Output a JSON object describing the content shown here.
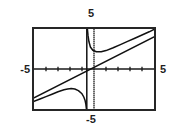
{
  "figure": {
    "type": "graphing-calculator-plot",
    "frame": {
      "x": 32,
      "y": 27,
      "width": 124,
      "height": 84
    }
  },
  "labels": {
    "top": "5",
    "bottom": "-5",
    "left": "-5",
    "right": "5"
  },
  "colors": {
    "frame": "#262626",
    "axis": "#1a1a1a",
    "curve": "#111111",
    "background": "#ffffff"
  },
  "chart_data": {
    "type": "line",
    "title": "",
    "xlabel": "",
    "ylabel": "",
    "xlim": [
      -5,
      5
    ],
    "ylim": [
      -5,
      5
    ],
    "xticks": [
      -4,
      -3,
      -2,
      -1,
      1,
      2,
      3,
      4
    ],
    "yticks": [
      -4,
      -3,
      -2,
      -1,
      1,
      2,
      3,
      4
    ],
    "grid": false,
    "legend": false,
    "axis_tick_labels": {
      "x_min": "-5",
      "x_max": "5",
      "y_min": "-5",
      "y_max": "5"
    },
    "vertical_asymptote": -0.6,
    "series": [
      {
        "name": "slant-asymptote",
        "style": "solid-line",
        "x": [
          -5,
          5
        ],
        "values": [
          -3.6,
          4.0
        ]
      },
      {
        "name": "rational-curve-left-branch",
        "style": "solid-curve",
        "x": [
          -5.0,
          -4.5,
          -4.0,
          -3.5,
          -3.0,
          -2.5,
          -2.2,
          -1.9,
          -1.6,
          -1.3,
          -1.0,
          -0.85,
          -0.75,
          -0.68,
          -0.63
        ],
        "values": [
          -4.05,
          -3.75,
          -3.45,
          -3.15,
          -2.85,
          -2.6,
          -2.5,
          -2.45,
          -2.5,
          -2.7,
          -3.1,
          -3.5,
          -3.9,
          -4.4,
          -5.0
        ]
      },
      {
        "name": "rational-curve-right-branch",
        "style": "solid-curve",
        "x": [
          -0.55,
          -0.5,
          -0.42,
          -0.3,
          -0.1,
          0.2,
          0.6,
          1.0,
          1.6,
          2.2,
          2.8,
          3.4,
          4.0,
          4.6,
          5.0
        ],
        "values": [
          5.0,
          4.2,
          3.4,
          2.75,
          2.35,
          2.15,
          2.15,
          2.3,
          2.65,
          3.05,
          3.45,
          3.85,
          4.25,
          4.65,
          4.95
        ]
      }
    ]
  }
}
